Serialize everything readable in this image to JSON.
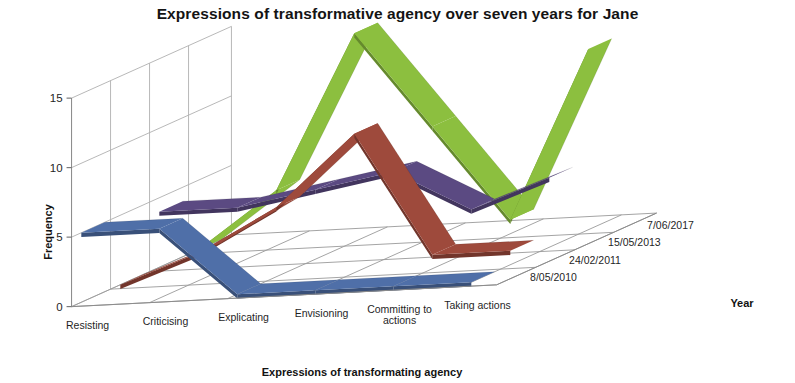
{
  "chart_data": {
    "type": "line",
    "title": "Expressions of transformative agency over seven years for Jane",
    "xlabel": "Expressions of transformating agency",
    "ylabel": "Frequency",
    "zlabel": "Year",
    "categories": [
      "Resisting",
      "Criticising",
      "Explicating",
      "Envisioning",
      "Committing to actions",
      "Taking actions"
    ],
    "ylim": [
      0,
      15
    ],
    "yticks": [
      0,
      5,
      10,
      15
    ],
    "grid": true,
    "legend": "none",
    "projection": "3d-ribbon",
    "series": [
      {
        "name": "8/05/2010",
        "color": "#4F6FA8",
        "values": [
          5,
          5,
          0,
          0,
          0,
          0
        ]
      },
      {
        "name": "24/02/2011",
        "color": "#9E4A3C",
        "values": [
          0,
          2,
          5,
          10,
          1,
          1
        ]
      },
      {
        "name": "15/05/2013",
        "color": "#5B4A82",
        "values": [
          4,
          4,
          5,
          6,
          3,
          5
        ]
      },
      {
        "name": "7/06/2017",
        "color": "#8CBF3F",
        "values": [
          0,
          4,
          15,
          8,
          1,
          13
        ]
      }
    ]
  },
  "axes": {
    "y_tick_labels": [
      "0",
      "5",
      "10",
      "15"
    ],
    "category_labels": [
      "Resisting",
      "Criticising",
      "Explicating",
      "Envisioning",
      "Committing to",
      "Taking actions"
    ],
    "category_label_extra": "actions",
    "series_labels": [
      "8/05/2010",
      "24/02/2011",
      "15/05/2013",
      "7/06/2017"
    ],
    "y_axis_title": "Frequency",
    "x_axis_title": "Expressions of transformating agency",
    "z_axis_title": "Year"
  }
}
